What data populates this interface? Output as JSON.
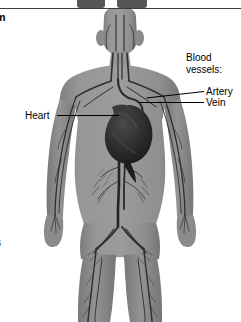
{
  "page": {
    "title_clipped": "tem",
    "bottom_left_clipped": "s",
    "background": "#ffffff"
  },
  "figure": {
    "name": "human-circulatory-system",
    "body_fill": "#909090",
    "vessel_dark": "#2a2a2a",
    "vessel_mid": "#4a4a4a",
    "heart_fill": "#262626",
    "outline": "#6f6f6f"
  },
  "labels": {
    "vessels_heading_line1": "Blood",
    "vessels_heading_line2": "vessels:",
    "artery": "Artery",
    "vein": "Vein",
    "heart": "Heart"
  },
  "top_strip": {
    "rule_color": "#3c3c3c",
    "foot_color": "#565656"
  },
  "icons": {
    "leader_line": "leader-line"
  }
}
